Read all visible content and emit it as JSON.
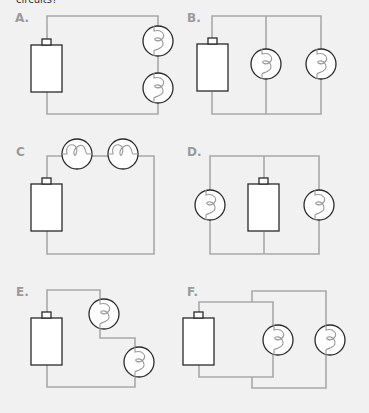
{
  "caption": "circuits?",
  "panels": [
    {
      "label": "A.",
      "description": "Series circuit: battery with two bulbs on right side, one above the other"
    },
    {
      "label": "B.",
      "description": "Parallel circuit: battery with two bulbs on separate parallel branches"
    },
    {
      "label": "C",
      "description": "Series circuit: two bulbs side by side on top wire"
    },
    {
      "label": "D.",
      "description": "Parallel circuit: battery in middle branch, bulbs on left and right branches"
    },
    {
      "label": "E.",
      "description": "Series circuit: two bulbs in a stepped wire path"
    },
    {
      "label": "F.",
      "description": "Two overlapping loops: battery with two bulbs, one on each loop"
    }
  ],
  "colors": {
    "background": "#f1f1f1",
    "wire": "#a9a9a9",
    "outline": "#2a2a2a",
    "label": "#9a9a9a"
  }
}
